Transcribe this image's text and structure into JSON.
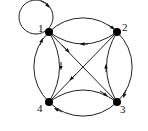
{
  "diagram": {
    "type": "directed-graph",
    "nodes": [
      {
        "id": "1",
        "label": "1",
        "x": 49,
        "y": 32
      },
      {
        "id": "2",
        "label": "2",
        "x": 117,
        "y": 32
      },
      {
        "id": "3",
        "label": "3",
        "x": 117,
        "y": 102
      },
      {
        "id": "4",
        "label": "4",
        "x": 49,
        "y": 102
      }
    ],
    "edges": [
      {
        "from": "1",
        "to": "1",
        "kind": "self-loop"
      },
      {
        "from": "1",
        "to": "2",
        "kind": "outer-arc"
      },
      {
        "from": "2",
        "to": "1",
        "kind": "inner-arc"
      },
      {
        "from": "2",
        "to": "3",
        "kind": "outer-arc"
      },
      {
        "from": "3",
        "to": "2",
        "kind": "inner-arc"
      },
      {
        "from": "3",
        "to": "4",
        "kind": "outer-arc"
      },
      {
        "from": "4",
        "to": "3",
        "kind": "inner-arc"
      },
      {
        "from": "4",
        "to": "1",
        "kind": "outer-arc"
      },
      {
        "from": "1",
        "to": "4",
        "kind": "inner-arc"
      },
      {
        "from": "1",
        "to": "3",
        "kind": "diagonal"
      },
      {
        "from": "2",
        "to": "4",
        "kind": "diagonal"
      }
    ],
    "colors": {
      "stroke": "#222222",
      "node": "#000000",
      "background": "#ffffff"
    }
  }
}
